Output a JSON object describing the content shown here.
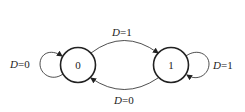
{
  "diagram": {
    "type": "state-transition",
    "colors": {
      "stroke": "#222222",
      "background": "#ffffff"
    },
    "states": [
      {
        "id": "s0",
        "label": "0"
      },
      {
        "id": "s1",
        "label": "1"
      }
    ],
    "transitions": [
      {
        "from": "0",
        "to": "0",
        "var": "D",
        "eq": "=",
        "val": "0",
        "label": "D=0"
      },
      {
        "from": "0",
        "to": "1",
        "var": "D",
        "eq": "=",
        "val": "1",
        "label": "D=1"
      },
      {
        "from": "1",
        "to": "1",
        "var": "D",
        "eq": "=",
        "val": "1",
        "label": "D=1"
      },
      {
        "from": "1",
        "to": "0",
        "var": "D",
        "eq": "=",
        "val": "0",
        "label": "D=0"
      }
    ]
  }
}
